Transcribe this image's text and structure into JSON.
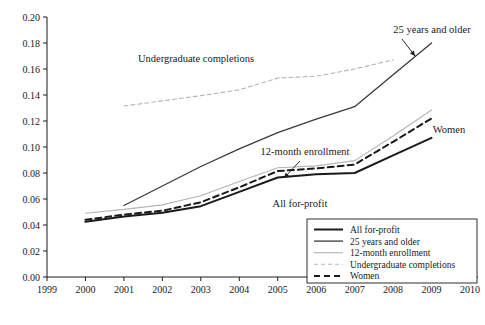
{
  "chart_data": {
    "type": "line",
    "title": "",
    "xlabel": "",
    "ylabel": "",
    "xlim": [
      1999,
      2010
    ],
    "ylim": [
      0.0,
      0.2
    ],
    "grid": false,
    "legend_position": "bottom-right",
    "x_ticks": [
      "1999",
      "2000",
      "2001",
      "2002",
      "2003",
      "2004",
      "2005",
      "2006",
      "2007",
      "2008",
      "2009",
      "2010"
    ],
    "y_ticks": [
      "0.00",
      "0.02",
      "0.04",
      "0.06",
      "0.08",
      "0.10",
      "0.12",
      "0.14",
      "0.16",
      "0.18",
      "0.20"
    ],
    "series": [
      {
        "name": "All for-profit",
        "style": "solid-thick",
        "color": "#1a1a1a",
        "x": [
          2000,
          2001,
          2002,
          2003,
          2004,
          2005,
          2006,
          2007,
          2008,
          2009
        ],
        "values": [
          0.0425,
          0.0465,
          0.0495,
          0.0545,
          0.0655,
          0.0765,
          0.079,
          0.08,
          0.0935,
          0.107
        ]
      },
      {
        "name": "25 years and older",
        "style": "solid-medium",
        "color": "#3a3a3a",
        "x": [
          2001,
          2002,
          2003,
          2004,
          2005,
          2006,
          2007,
          2008,
          2009
        ],
        "values": [
          0.055,
          0.07,
          0.085,
          0.0985,
          0.111,
          0.1215,
          0.131,
          0.1555,
          0.18
        ]
      },
      {
        "name": "12-month enrollment",
        "style": "solid-light",
        "color": "#b4b4b4",
        "x": [
          2000,
          2001,
          2002,
          2003,
          2004,
          2005,
          2006,
          2007,
          2008,
          2009
        ],
        "values": [
          0.049,
          0.052,
          0.0555,
          0.0625,
          0.0735,
          0.084,
          0.0855,
          0.0895,
          0.1085,
          0.1285
        ]
      },
      {
        "name": "Undergraduate completions",
        "style": "dashed-light",
        "color": "#b4b4b4",
        "x": [
          2001,
          2002,
          2003,
          2004,
          2005,
          2006,
          2007,
          2008
        ],
        "values": [
          0.1315,
          0.1355,
          0.1395,
          0.144,
          0.153,
          0.1545,
          0.16,
          0.167
        ]
      },
      {
        "name": "Women",
        "style": "dashed-thick",
        "color": "#1a1a1a",
        "x": [
          2000,
          2001,
          2002,
          2003,
          2004,
          2005,
          2006,
          2007,
          2008,
          2009
        ],
        "values": [
          0.044,
          0.048,
          0.051,
          0.0575,
          0.069,
          0.0815,
          0.0835,
          0.0865,
          0.104,
          0.122
        ]
      }
    ],
    "annotations": [
      {
        "text": "Undergraduate completions",
        "x": 196,
        "y": 62,
        "anchor": "middle"
      },
      {
        "text": "25 years and older",
        "x": 432,
        "y": 33,
        "anchor": "middle"
      },
      {
        "text": "12-month enrollment",
        "x": 305,
        "y": 155,
        "anchor": "middle"
      },
      {
        "text": "Women",
        "x": 449,
        "y": 133,
        "anchor": "middle"
      },
      {
        "text": "All for-profit",
        "x": 300,
        "y": 207,
        "anchor": "middle"
      }
    ],
    "arrows": [
      {
        "from_x": 402,
        "from_y": 39,
        "to_x": 415,
        "to_y": 56
      },
      {
        "from_x": 300,
        "from_y": 161,
        "to_x": 284,
        "to_y": 178
      }
    ],
    "legend_entries": [
      {
        "label": "All for-profit",
        "style": "solid-thick",
        "color": "#1a1a1a"
      },
      {
        "label": "25 years and older",
        "style": "solid-medium",
        "color": "#3a3a3a"
      },
      {
        "label": "12-month enrollment",
        "style": "solid-light",
        "color": "#b4b4b4"
      },
      {
        "label": "Undergraduate completions",
        "style": "dashed-light",
        "color": "#b4b4b4"
      },
      {
        "label": "Women",
        "style": "dashed-thick",
        "color": "#1a1a1a"
      }
    ]
  }
}
